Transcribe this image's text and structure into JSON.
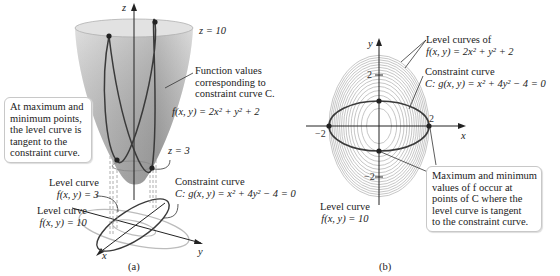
{
  "panel_a": {
    "caption": "(a)",
    "axis_z": "z",
    "axis_x": "x",
    "axis_y": "y",
    "label_z10": "z = 10",
    "label_z3": "z = 3",
    "function_values_label": [
      "Function values",
      "corresponding to",
      "constraint curve C."
    ],
    "function_label": "f(x, y) = 2x² + y² + 2",
    "callout": [
      "At maximum and",
      "minimum points,",
      "the level curve is",
      "tangent to the",
      "constraint curve."
    ],
    "level_curve_3": [
      "Level curve",
      "f(x, y) = 3"
    ],
    "level_curve_10": [
      "Level curve",
      "f(x, y) = 10"
    ],
    "constraint_label": [
      "Constraint curve",
      "C: g(x, y) = x² + 4y² − 4 = 0"
    ]
  },
  "panel_b": {
    "caption": "(b)",
    "axis_x": "x",
    "axis_y": "y",
    "ticks": {
      "x_pos": "2",
      "x_neg": "−2",
      "y_pos": "2",
      "y_neg": "−2"
    },
    "level_curves_label": [
      "Level curves of",
      "f(x, y) = 2x² + y² + 2"
    ],
    "constraint_label": [
      "Constraint curve",
      "C: g(x, y) = x² + 4y² − 4 = 0"
    ],
    "level_curve_10": [
      "Level curve",
      "f(x, y) = 10"
    ],
    "callout": [
      "Maximum and minimum",
      "values of f occur at",
      "points of C where the",
      "level curve is tangent",
      "to the constraint curve."
    ],
    "level_values": [
      2.5,
      3,
      3.5,
      4,
      4.5,
      5,
      5.5,
      6,
      6.5,
      7,
      7.5,
      8,
      8.5,
      9,
      9.5,
      10
    ],
    "tangent_points": [
      [
        -2,
        0
      ],
      [
        2,
        0
      ],
      [
        0,
        1
      ],
      [
        0,
        -1
      ]
    ]
  },
  "colors": {
    "surface": "#c9c9c9",
    "surface_dark": "#9a9a9a",
    "curve": "#3a3a3a",
    "level": "#b8b8b8",
    "axis": "#222222"
  }
}
